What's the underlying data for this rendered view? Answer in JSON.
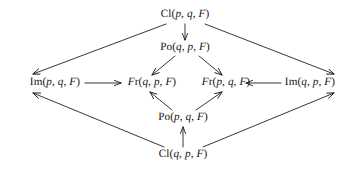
{
  "diagram": {
    "type": "commutative-diagram",
    "title": "",
    "background_color": "#ffffff",
    "stroke_color": "#141414",
    "text_color": "#141414",
    "nodes": [
      {
        "id": "cl-p-q-F",
        "label": "Cl(p, q, F)",
        "function": "Cl",
        "args": [
          "p",
          "q",
          "F"
        ],
        "x": 185,
        "y": 15
      },
      {
        "id": "po-q-p-F",
        "label": "Po(q, p, F)",
        "function": "Po",
        "args": [
          "q",
          "p",
          "F"
        ],
        "x": 185,
        "y": 48
      },
      {
        "id": "im-p-q-F",
        "label": "Im(p, q, F)",
        "function": "Im",
        "args": [
          "p",
          "q",
          "F"
        ],
        "x": 55,
        "y": 83
      },
      {
        "id": "fr-q-p-F",
        "label": "Fr(q, p, F)",
        "function": "Fr",
        "args": [
          "q",
          "p",
          "F"
        ],
        "x": 152,
        "y": 83
      },
      {
        "id": "fr-p-q-F",
        "label": "Fr(p, q, F)",
        "function": "Fr",
        "args": [
          "p",
          "q",
          "F"
        ],
        "x": 226,
        "y": 83
      },
      {
        "id": "im-q-p-F",
        "label": "Im(q, p, F)",
        "function": "Im",
        "args": [
          "q",
          "p",
          "F"
        ],
        "x": 310,
        "y": 83
      },
      {
        "id": "po-p-q-F",
        "label": "Po(p, q, F)",
        "function": "Po",
        "args": [
          "p",
          "q",
          "F"
        ],
        "x": 183,
        "y": 118
      },
      {
        "id": "cl-q-p-F",
        "label": "Cl(q, p, F)",
        "function": "Cl",
        "args": [
          "q",
          "p",
          "F"
        ],
        "x": 183,
        "y": 155
      }
    ],
    "edges": [
      {
        "id": "e1",
        "from": "cl-p-q-F",
        "to": "im-p-q-F",
        "direction": "down-left",
        "x1": 166,
        "y1": 24,
        "x2": 33,
        "y2": 74
      },
      {
        "id": "e2",
        "from": "cl-p-q-F",
        "to": "im-q-p-F",
        "direction": "down-right",
        "x1": 205,
        "y1": 24,
        "x2": 334,
        "y2": 74
      },
      {
        "id": "e3",
        "from": "cl-p-q-F",
        "to": "po-q-p-F",
        "direction": "down",
        "x1": 185,
        "y1": 24,
        "x2": 185,
        "y2": 40
      },
      {
        "id": "e4",
        "from": "po-q-p-F",
        "to": "fr-q-p-F",
        "direction": "down-left",
        "x1": 175,
        "y1": 56,
        "x2": 152,
        "y2": 75
      },
      {
        "id": "e5",
        "from": "po-q-p-F",
        "to": "fr-p-q-F",
        "direction": "down-right",
        "x1": 199,
        "y1": 56,
        "x2": 222,
        "y2": 75
      },
      {
        "id": "e6",
        "from": "im-p-q-F",
        "to": "fr-q-p-F",
        "direction": "right",
        "x1": 85,
        "y1": 83,
        "x2": 121,
        "y2": 83
      },
      {
        "id": "e7",
        "from": "im-q-p-F",
        "to": "fr-p-q-F",
        "direction": "left",
        "x1": 281,
        "y1": 83,
        "x2": 246,
        "y2": 83
      },
      {
        "id": "e8",
        "from": "po-p-q-F",
        "to": "fr-q-p-F",
        "direction": "up-left",
        "x1": 172,
        "y1": 110,
        "x2": 150,
        "y2": 92
      },
      {
        "id": "e9",
        "from": "po-p-q-F",
        "to": "fr-p-q-F",
        "direction": "up-right",
        "x1": 196,
        "y1": 110,
        "x2": 222,
        "y2": 92
      },
      {
        "id": "e10",
        "from": "cl-q-p-F",
        "to": "po-p-q-F",
        "direction": "up",
        "x1": 183,
        "y1": 147,
        "x2": 183,
        "y2": 127
      },
      {
        "id": "e11",
        "from": "cl-q-p-F",
        "to": "im-p-q-F",
        "direction": "up-left",
        "x1": 164,
        "y1": 147,
        "x2": 33,
        "y2": 93
      },
      {
        "id": "e12",
        "from": "cl-q-p-F",
        "to": "im-q-p-F",
        "direction": "up-right",
        "x1": 203,
        "y1": 147,
        "x2": 334,
        "y2": 93
      }
    ]
  }
}
